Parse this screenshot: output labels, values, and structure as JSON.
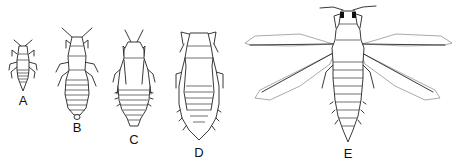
{
  "figure": {
    "panels": [
      {
        "id": "A",
        "label": "A",
        "x": 23,
        "label_y": 101
      },
      {
        "id": "B",
        "label": "B",
        "x": 77,
        "label_y": 128
      },
      {
        "id": "C",
        "label": "C",
        "x": 134,
        "label_y": 140
      },
      {
        "id": "D",
        "label": "D",
        "x": 199,
        "label_y": 146
      },
      {
        "id": "E",
        "label": "E",
        "x": 348,
        "label_y": 147
      }
    ]
  }
}
